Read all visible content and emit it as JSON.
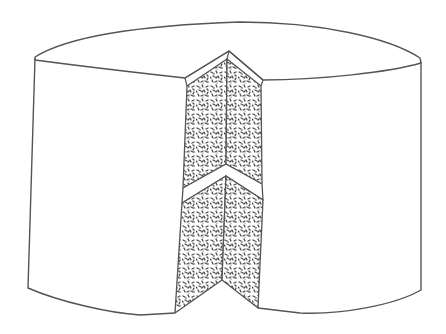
{
  "image": {
    "subject": "line drawing of a round cake with a wedge slice removed",
    "width": 446,
    "height": 334
  },
  "colors": {
    "background": "#ffffff",
    "outline": "#555555",
    "crumb_fill": "#ffffff",
    "crumb_speckle": "#4a4a4a"
  },
  "parts": {
    "cake_top": "cake-top-surface",
    "cake_side": "cake-side-wall",
    "slice_cut": "exposed-slice-interior",
    "upper_layer": "upper-sponge-layer",
    "frosting_band": "middle-frosting-band",
    "lower_layer": "lower-sponge-layer"
  }
}
